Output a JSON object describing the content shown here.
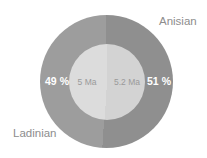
{
  "chart_data": {
    "type": "pie",
    "subtype": "donut",
    "title": "",
    "start_angle_deg": 0,
    "direction": "clockwise",
    "legend_position": "outside-labels",
    "slices": [
      {
        "label": "Anisian",
        "value": 51,
        "percent_label": "51 %",
        "duration_label": "5.2 Ma",
        "side": "right",
        "ring_color": "#8f8f8f",
        "inner_color": "#d3d3d3"
      },
      {
        "label": "Ladinian",
        "value": 49,
        "percent_label": "49 %",
        "duration_label": "5 Ma",
        "side": "left",
        "ring_color": "#9d9d9d",
        "inner_color": "#dcdcdc"
      }
    ],
    "colors": {
      "percent_text": "#ffffff",
      "duration_text": "#9a9a9a",
      "category_text": "#8d8d8d",
      "background": "#ffffff"
    }
  }
}
